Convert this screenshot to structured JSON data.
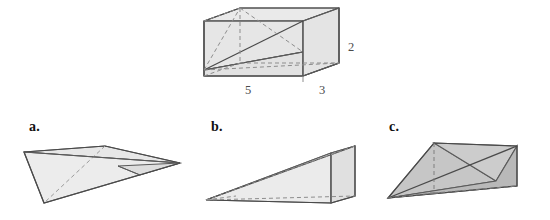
{
  "figure": {
    "colors": {
      "outline": "#5a5a5a",
      "outline_dark": "#4a4a4a",
      "fill_light": "#e9e9e9",
      "fill_medium": "#d8d8d8",
      "fill_shade": "#c9c9c9",
      "fill_dark": "#b4b4b4",
      "dashed": "#8d8d8d",
      "label_text": "#111111",
      "dimension_text": "#4b4b4b",
      "background": "#ffffff"
    },
    "prism": {
      "name": "rectangular-prism",
      "dimensions": [
        {
          "label": "5",
          "edge": "front-bottom-left"
        },
        {
          "label": "3",
          "edge": "front-bottom-right"
        },
        {
          "label": "2",
          "edge": "right-vertical-height"
        }
      ]
    },
    "choices": [
      {
        "key": "a",
        "label": "a.",
        "shape": "flat-thin-pyramid"
      },
      {
        "key": "b",
        "label": "b.",
        "shape": "wedge-ramp-pyramid"
      },
      {
        "key": "c",
        "label": "c.",
        "shape": "broad-shaded-pyramid"
      }
    ]
  }
}
